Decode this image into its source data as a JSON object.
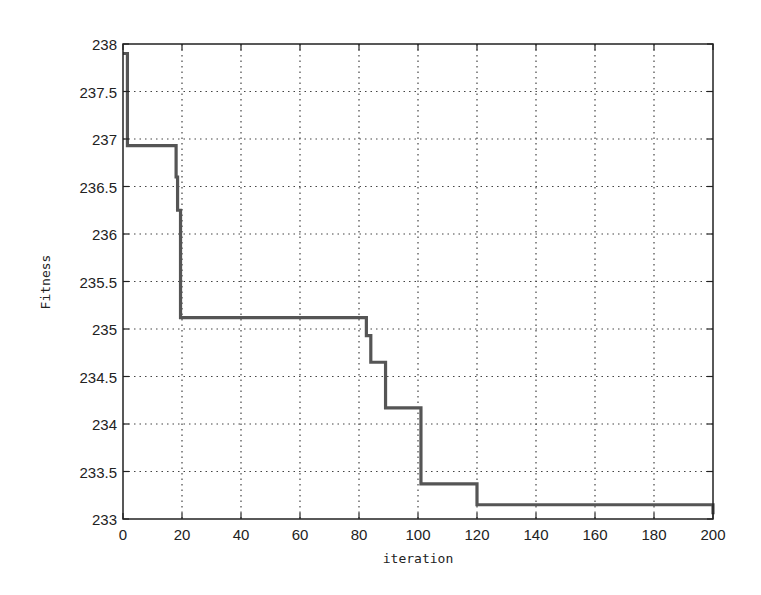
{
  "chart_data": {
    "type": "line",
    "title": "",
    "xlabel": "iteration",
    "ylabel": "Fitness",
    "xlim": [
      0,
      200
    ],
    "ylim": [
      233,
      238
    ],
    "grid": true,
    "legend": null,
    "xticks": [
      0,
      20,
      40,
      60,
      80,
      100,
      120,
      140,
      160,
      180,
      200
    ],
    "yticks": [
      233,
      233.5,
      234,
      234.5,
      235,
      235.5,
      236,
      236.5,
      237,
      237.5,
      238
    ],
    "ytick_labels": [
      "233",
      "233.5",
      "234",
      "234.5",
      "235",
      "235.5",
      "236",
      "236.5",
      "237",
      "237.5",
      "238"
    ],
    "series": [
      {
        "name": "best fitness",
        "color": "#555555",
        "step": true,
        "x": [
          0,
          1,
          1.5,
          18,
          18.5,
          19.5,
          81,
          82.5,
          84,
          87,
          89,
          100,
          101,
          119.5,
          120,
          198,
          200
        ],
        "y": [
          237.9,
          237.9,
          236.93,
          236.6,
          236.25,
          235.12,
          235.12,
          234.93,
          234.65,
          234.65,
          234.17,
          234.17,
          233.37,
          233.37,
          233.15,
          233.15,
          233.05
        ]
      }
    ]
  }
}
